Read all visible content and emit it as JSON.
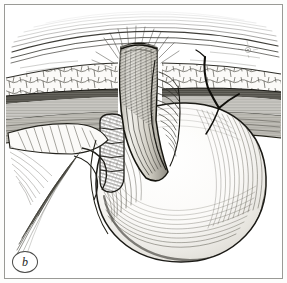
{
  "figure": {
    "panel_label": "b",
    "caption": "",
    "medium": "pen-and-ink line engraving",
    "orientation": "cross-sectional view",
    "background_color": "#ffffff",
    "ink_color": "#1d1d1b",
    "frame_color": "#9a9a96",
    "width_px": 287,
    "height_px": 283
  },
  "anatomy": {
    "layers": [
      {
        "name": "skin-surface",
        "label": "Skin",
        "texture": "long arcing parallel hatch lines",
        "tone": "#4a4a48"
      },
      {
        "name": "subcutaneous-fat",
        "label": "Subcutaneous fat",
        "texture": "cobblestone lobules / irregular polygons",
        "tone": "#6d6d69"
      },
      {
        "name": "anterior-fascia",
        "label": "Anterior rectus fascia",
        "texture": "dense dark horizontal band",
        "tone": "#2a2a28"
      },
      {
        "name": "muscle-layer",
        "label": "Rectus muscle",
        "texture": "fine horizontal hatching",
        "tone": "#57574f"
      },
      {
        "name": "posterior-fascia-peritoneum",
        "label": "Posterior fascia / peritoneum",
        "texture": "dark stippled band",
        "tone": "#3a3a38"
      }
    ],
    "structures": [
      {
        "name": "stoma-spout",
        "label": "Everted stoma spout",
        "description": "bowel limb protruding above the skin with radiating elevation lines"
      },
      {
        "name": "efferent-limb",
        "label": "Efferent bowel limb",
        "description": "tubular limb descending through the abdominal wall"
      },
      {
        "name": "afferent-limb",
        "label": "Afferent bowel limb",
        "description": "haustrated segmented bowel ascending to the stoma"
      },
      {
        "name": "bowel-loop-body",
        "label": "Distended bowel loop",
        "description": "large rounded viscus filling the lower right field"
      },
      {
        "name": "mesentery",
        "label": "Mesentery",
        "description": "fan of sweeping strands radiating to the lower left"
      },
      {
        "name": "suture-thread",
        "label": "Fascial suture",
        "description": "dark thread passing from skin through fascia into bowel wall on the right"
      }
    ]
  },
  "annotations": {
    "panel_marker": {
      "name": "panel-label-b",
      "text": "b",
      "shape": "circle",
      "position": "bottom-left"
    }
  }
}
